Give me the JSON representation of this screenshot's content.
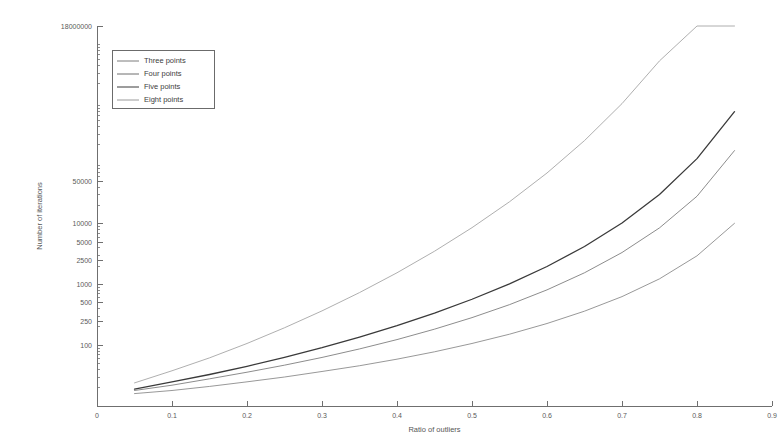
{
  "chart_data": {
    "type": "line",
    "title": "",
    "xlabel": "Ratio of outliers",
    "ylabel": "Number of iterations",
    "yscale": "log",
    "xscale": "linear",
    "xlim": [
      0,
      0.9
    ],
    "ylim": [
      10,
      18000000
    ],
    "grid": false,
    "legend_position": "top-left",
    "xticks": [
      0,
      0.1,
      0.2,
      0.3,
      0.4,
      0.5,
      0.6,
      0.7,
      0.8,
      0.9
    ],
    "xticklabels": [
      "0",
      "0.1",
      "0.2",
      "0.3",
      "0.4",
      "0.5",
      "0.6",
      "0.7",
      "0.8",
      "0.9"
    ],
    "yticks": [
      100,
      250,
      500,
      1000,
      2500,
      5000,
      10000,
      50000,
      18000000
    ],
    "yticklabels": [
      "100",
      "250",
      "500",
      "1000",
      "2500",
      "5000",
      "10000",
      "50000",
      "18000000"
    ],
    "x": [
      0.05,
      0.1,
      0.15,
      0.2,
      0.25,
      0.3,
      0.35,
      0.4,
      0.45,
      0.5,
      0.55,
      0.6,
      0.65,
      0.7,
      0.75,
      0.8,
      0.85
    ],
    "series": [
      {
        "name": "Three points",
        "color": "#7d7d7d",
        "width": 0.8,
        "values": [
          16,
          18,
          21,
          25,
          30,
          37,
          46,
          59,
          78,
          107,
          152,
          228,
          364,
          632,
          1240,
          2965,
          10160
        ]
      },
      {
        "name": "Four points",
        "color": "#6e6e6e",
        "width": 0.8,
        "values": [
          18,
          22,
          28,
          36,
          47,
          63,
          87,
          124,
          184,
          285,
          466,
          816,
          1560,
          3360,
          8560,
          28400,
          160000
        ]
      },
      {
        "name": "Five points",
        "color": "#3a3a3a",
        "width": 1.3,
        "values": [
          19,
          25,
          33,
          45,
          63,
          91,
          136,
          210,
          338,
          572,
          1025,
          1980,
          4220,
          10300,
          30400,
          118000,
          700000
        ]
      },
      {
        "name": "Eight points",
        "color": "#9a9a9a",
        "width": 0.8,
        "values": [
          24,
          38,
          62,
          107,
          194,
          368,
          736,
          1560,
          3530,
          8620,
          23000,
          68500,
          234000,
          950000,
          4800000,
          33000000,
          320000000
        ]
      }
    ]
  },
  "legend": {
    "items": [
      {
        "label": "Three points"
      },
      {
        "label": "Four points"
      },
      {
        "label": "Five points"
      },
      {
        "label": "Eight points"
      }
    ]
  }
}
